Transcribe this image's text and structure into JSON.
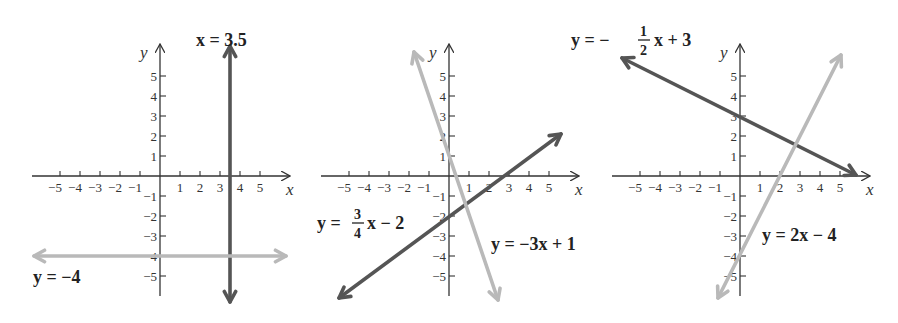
{
  "figure": {
    "colors": {
      "dark_line": "#555555",
      "light_line": "#b9b9b9",
      "axis": "#333333",
      "text": "#222222"
    }
  },
  "chart_data": [
    {
      "type": "line",
      "panel": 1,
      "xlabel": "x",
      "ylabel": "y",
      "xlim": [
        -5,
        5
      ],
      "ylim": [
        -5,
        5
      ],
      "x_ticks": [
        -5,
        -4,
        -3,
        -2,
        -1,
        1,
        2,
        3,
        4,
        5
      ],
      "y_ticks": [
        -5,
        -4,
        -3,
        -2,
        -1,
        1,
        2,
        3,
        4,
        5
      ],
      "grid": false,
      "series": [
        {
          "name": "x = 3.5",
          "kind": "vertical",
          "x": 3.5,
          "color": "dark",
          "p1": [
            3.5,
            6.5
          ],
          "p2": [
            3.5,
            -6.3
          ]
        },
        {
          "name": "y = −4",
          "kind": "horizontal",
          "y": -4,
          "color": "light",
          "p1": [
            -6.3,
            -4
          ],
          "p2": [
            6.3,
            -4
          ]
        }
      ],
      "annotations": [
        {
          "text": "x = 3.5",
          "at": "top of vertical line"
        },
        {
          "text": "y = −4",
          "at": "below left end of horizontal line"
        }
      ]
    },
    {
      "type": "line",
      "panel": 2,
      "xlabel": "x",
      "ylabel": "y",
      "xlim": [
        -5,
        5
      ],
      "ylim": [
        -5,
        5
      ],
      "x_ticks": [
        -5,
        -4,
        -3,
        -2,
        -1,
        1,
        2,
        3,
        4,
        5
      ],
      "y_ticks": [
        -5,
        -4,
        -3,
        -2,
        -1,
        1,
        2,
        3,
        4,
        5
      ],
      "grid": false,
      "series": [
        {
          "name": "y = (3/4)x − 2",
          "slope": 0.75,
          "intercept": -2,
          "color": "dark",
          "p1": [
            -5.5,
            -6.1
          ],
          "p2": [
            5.6,
            2.1
          ]
        },
        {
          "name": "y = −3x + 1",
          "slope": -3,
          "intercept": 1,
          "color": "light",
          "p1": [
            -1.75,
            6.2
          ],
          "p2": [
            2.45,
            -6.2
          ]
        }
      ],
      "annotations": [
        {
          "text": "y = 3/4 x − 2",
          "at": "left of y-axis near y = −2"
        },
        {
          "text": "y = −3x + 1",
          "at": "right, near y = −3"
        }
      ]
    },
    {
      "type": "line",
      "panel": 3,
      "xlabel": "x",
      "ylabel": "y",
      "xlim": [
        -5,
        5
      ],
      "ylim": [
        -5,
        5
      ],
      "x_ticks": [
        -5,
        -4,
        -3,
        -2,
        -1,
        1,
        2,
        3,
        4,
        5
      ],
      "y_ticks": [
        -5,
        -4,
        -3,
        -2,
        -1,
        1,
        2,
        3,
        4,
        5
      ],
      "grid": false,
      "series": [
        {
          "name": "y = −(1/2)x + 3",
          "slope": -0.5,
          "intercept": 3,
          "color": "dark",
          "p1": [
            -5.9,
            5.9
          ],
          "p2": [
            5.8,
            0.05
          ]
        },
        {
          "name": "y = 2x − 4",
          "slope": 2,
          "intercept": -4,
          "color": "light",
          "p1": [
            -1.1,
            -6.1
          ],
          "p2": [
            5.05,
            6.05
          ]
        }
      ],
      "annotations": [
        {
          "text": "y = −1/2 x + 3",
          "at": "top-left"
        },
        {
          "text": "y = 2x − 4",
          "at": "right, near y = −3"
        }
      ]
    }
  ],
  "labels": {
    "axis_x": "x",
    "axis_y": "y",
    "panel1": {
      "eq_vertical": "x = 3.5",
      "eq_horizontal": "y = −4"
    },
    "panel2": {
      "eq_dark_y": "y =",
      "eq_dark_num": "3",
      "eq_dark_den": "4",
      "eq_dark_rest": "x − 2",
      "eq_light": "y = −3x + 1"
    },
    "panel3": {
      "eq_dark_y": "y = −",
      "eq_dark_num": "1",
      "eq_dark_den": "2",
      "eq_dark_rest": "x + 3",
      "eq_light": "y = 2x − 4"
    }
  },
  "panels_layout": [
    {
      "origin": [
        160,
        176
      ],
      "unit": 20
    },
    {
      "origin": [
        449,
        176
      ],
      "unit": 20
    },
    {
      "origin": [
        740,
        176
      ],
      "unit": 20
    }
  ]
}
